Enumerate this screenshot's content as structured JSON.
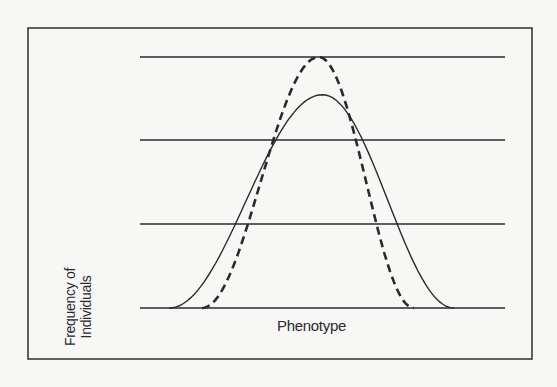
{
  "chart_data": {
    "type": "line",
    "title": "",
    "xlabel": "Phenotype",
    "ylabel": "Frequency of Individuals",
    "ylabel_lines": [
      "Frequency of",
      "Individuals"
    ],
    "grid": "horizontal lines (4)",
    "legend": "none",
    "x": [
      0,
      0.1,
      0.2,
      0.3,
      0.4,
      0.5,
      0.6,
      0.7,
      0.8,
      0.9,
      1.0
    ],
    "series": [
      {
        "name": "solid-curve",
        "style": "solid",
        "peak_x": 0.5,
        "peak_y": 0.85,
        "range_x": [
          0.08,
          0.86
        ]
      },
      {
        "name": "dashed-curve",
        "style": "dashed",
        "peak_x": 0.49,
        "peak_y": 1.0,
        "range_x": [
          0.17,
          0.75
        ]
      }
    ],
    "ylim": [
      0,
      1
    ],
    "gridlines_y": [
      0,
      0.333,
      0.667,
      1.0
    ]
  },
  "colors": {
    "line": "#2a2a2a",
    "background": "#f7f7f5",
    "frame": "#3a3a3a"
  }
}
